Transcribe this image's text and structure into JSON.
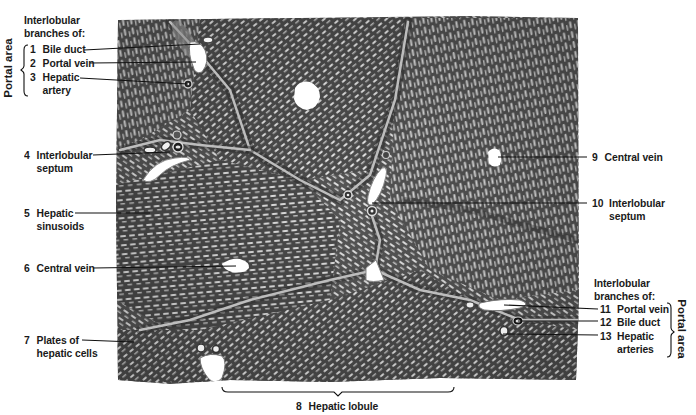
{
  "figure": {
    "background_color": "#ffffff",
    "tissue_colors": {
      "parenchyma_dark": "#3e3e3e",
      "parenchyma_mid": "#6b6b6b",
      "sinusoid_light": "#e6e6e6",
      "septum": "#9a9a9a",
      "lumen": "#ffffff"
    }
  },
  "labels": {
    "top_left_heading_line1": "Interlobular",
    "top_left_heading_line2": "branches of:",
    "top_left_bracket": "Portal area",
    "l1": {
      "num": "1",
      "text": "Bile duct"
    },
    "l2": {
      "num": "2",
      "text": "Portal vein"
    },
    "l3": {
      "num": "3",
      "text": "Hepatic",
      "text2": "artery"
    },
    "l4": {
      "num": "4",
      "text": "Interlobular",
      "text2": "septum"
    },
    "l5": {
      "num": "5",
      "text": "Hepatic",
      "text2": "sinusoids"
    },
    "l6": {
      "num": "6",
      "text": "Central vein"
    },
    "l7": {
      "num": "7",
      "text": "Plates of",
      "text2": "hepatic cells"
    },
    "l8": {
      "num": "8",
      "text": "Hepatic lobule"
    },
    "l9": {
      "num": "9",
      "text": "Central vein"
    },
    "l10": {
      "num": "10",
      "text": "Interlobular",
      "text2": "septum"
    },
    "bottom_right_heading_line1": "Interlobular",
    "bottom_right_heading_line2": "branches of:",
    "bottom_right_bracket": "Portal area",
    "l11": {
      "num": "11",
      "text": "Portal vein"
    },
    "l12": {
      "num": "12",
      "text": "Bile duct"
    },
    "l13": {
      "num": "13",
      "text": "Hepatic",
      "text2": "arteries"
    }
  }
}
